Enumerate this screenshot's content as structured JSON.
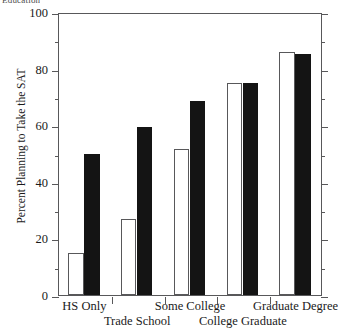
{
  "top_title": "Education",
  "chart_data": {
    "type": "bar",
    "title": "Education",
    "xlabel": "",
    "ylabel": "Percent Planning to Take the SAT",
    "ylim": [
      0,
      100
    ],
    "yticks": [
      0,
      20,
      40,
      60,
      80,
      100
    ],
    "ytick_labels": [
      "0",
      "20",
      "40",
      "60",
      "80",
      "100"
    ],
    "minor_yticks": [
      10,
      30,
      50,
      70,
      90
    ],
    "grid": false,
    "legend": null,
    "categories": [
      "HS Only",
      "Trade School",
      "Some College",
      "College Graduate",
      "Graduate Degree"
    ],
    "series": [
      {
        "name": "open",
        "style": "white-outlined",
        "values": [
          15,
          27,
          51.5,
          75,
          86
        ]
      },
      {
        "name": "solid",
        "style": "black-filled",
        "values": [
          50,
          59.5,
          68.5,
          75,
          85
        ]
      }
    ],
    "label_rows": [
      0,
      1,
      0,
      1,
      0
    ]
  },
  "axis": {
    "frame_color": "#58585a",
    "bar_open_fill": "#ffffff",
    "bar_open_stroke": "#58585a",
    "bar_solid_fill": "#141414"
  }
}
